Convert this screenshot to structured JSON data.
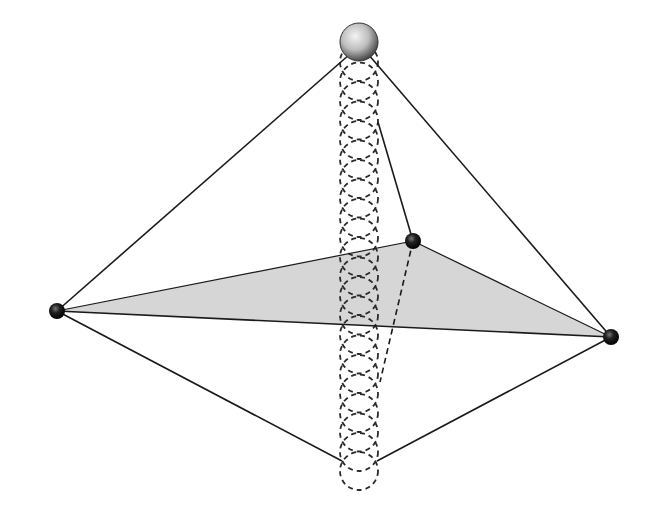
{
  "diagram": {
    "type": "trigonal-bipyramid-trajectory",
    "colors": {
      "line": "#1a1a1a",
      "equatorial_fill": "#d6d6d6",
      "vertex_fill": "#111111",
      "top_sphere_light": "#f2f2f2",
      "top_sphere_dark": "#555555",
      "dashed": "#2a2a2a"
    },
    "vertices": {
      "left": {
        "x": 57,
        "y": 311,
        "r": 8
      },
      "right": {
        "x": 611,
        "y": 337,
        "r": 8
      },
      "back": {
        "x": 413,
        "y": 241,
        "r": 8
      },
      "top": {
        "x": 359,
        "y": 42,
        "r": 19
      },
      "bottom": {
        "x": 359,
        "y": 471,
        "r": 19
      }
    },
    "trajectory": {
      "center_x": 359,
      "radius_x": 19,
      "radius_y": 19,
      "start_y": 62,
      "end_y": 452,
      "step": 19.5
    },
    "back_edge_top": {
      "x": 378,
      "y": 122
    },
    "back_edge_bottom": {
      "x": 380,
      "y": 382
    }
  }
}
